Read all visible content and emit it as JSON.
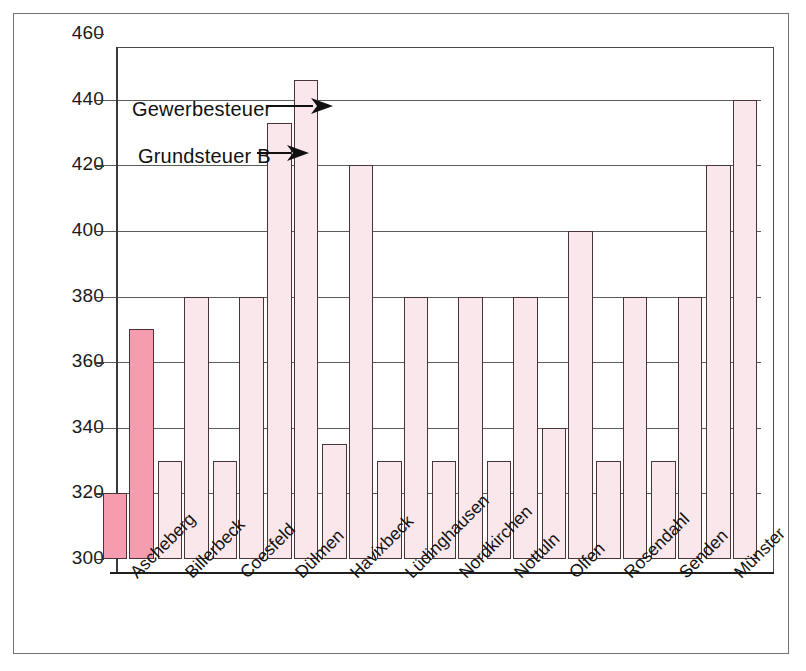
{
  "chart_data": {
    "type": "bar",
    "title": "",
    "xlabel": "",
    "ylabel": "",
    "ylim": [
      300,
      460
    ],
    "yticks": [
      300,
      320,
      340,
      360,
      380,
      400,
      420,
      440,
      460
    ],
    "grid": true,
    "legend_position": "inside-plot-annotations",
    "categories": [
      "Ascheberg",
      "Billerbeck",
      "Coesfeld",
      "Dülmen",
      "Havixbeck",
      "Lüdinghausen",
      "Nordkirchen",
      "Nottuln",
      "Olfen",
      "Rosendahl",
      "Senden",
      "Münster"
    ],
    "series": [
      {
        "name": "Grundsteuer B",
        "values": [
          320,
          330,
          330,
          433,
          335,
          330,
          330,
          330,
          340,
          330,
          330,
          420
        ]
      },
      {
        "name": "Gewerbesteuer",
        "values": [
          370,
          380,
          380,
          446,
          420,
          380,
          380,
          380,
          400,
          380,
          380,
          440
        ]
      }
    ],
    "annotations": [
      {
        "text": "Gewerbesteuer",
        "points_to": "Dülmen Gewerbesteuer bar"
      },
      {
        "text": "Grundsteuer B",
        "points_to": "Dülmen Grundsteuer B bar"
      }
    ],
    "highlighted_category": "Ascheberg",
    "colors": {
      "bar_default": "#fae7ec",
      "bar_highlight": "#f59cae",
      "bar_outline": "#4b3338",
      "gridline": "#5b5b5b",
      "axis": "#1f1f1f",
      "text": "#141414",
      "frame": "#6f7173",
      "background": "#ffffff"
    }
  },
  "axis": {
    "y_tick_labels": [
      "460",
      "440",
      "420",
      "400",
      "380",
      "360",
      "340",
      "320",
      "300"
    ]
  },
  "annotations": {
    "gewerbesteuer_label": "Gewerbesteuer",
    "grundsteuer_label": "Grundsteuer B"
  }
}
